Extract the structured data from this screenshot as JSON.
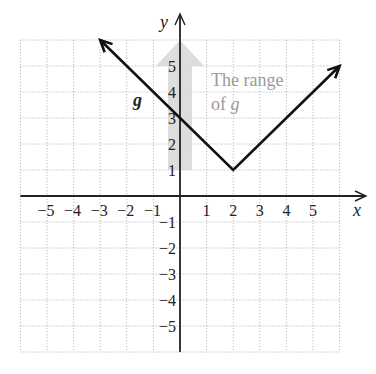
{
  "chart_data": {
    "type": "line",
    "title": "",
    "function": "g(x) = |x - 2| + 1",
    "xlabel": "x",
    "ylabel": "y",
    "xlim": [
      -6,
      6
    ],
    "ylim": [
      -6,
      6
    ],
    "grid": true,
    "x_ticks": [
      -5,
      -4,
      -3,
      -2,
      -1,
      1,
      2,
      3,
      4,
      5
    ],
    "y_ticks": [
      5,
      4,
      3,
      2,
      1,
      -1,
      -2,
      -3,
      -4,
      -5
    ],
    "x_tick_labels": [
      "−5",
      "−4",
      "−3",
      "−2",
      "−1",
      "1",
      "2",
      "3",
      "4",
      "5"
    ],
    "y_tick_labels": [
      "5",
      "4",
      "3",
      "2",
      "1",
      "−1",
      "−2",
      "−3",
      "−4",
      "−5"
    ],
    "series": [
      {
        "name": "g",
        "points": [
          [
            -3,
            6
          ],
          [
            2,
            1
          ],
          [
            6,
            5
          ]
        ],
        "arrows_at_ends": true,
        "vertex": [
          2,
          1
        ],
        "y_intercept": [
          0,
          3
        ]
      }
    ],
    "annotations": [
      {
        "text": "g",
        "at": [
          -1.4,
          3.6
        ],
        "style": "bold italic"
      },
      {
        "text_line1": "The range",
        "text_line2_prefix": "of ",
        "text_line2_var": "g",
        "at": [
          1.2,
          4.3
        ],
        "color": "#9a9a9a"
      },
      {
        "shape": "shaded-arrow",
        "from": [
          0,
          1
        ],
        "to": [
          0,
          6
        ],
        "color": "#d9d9d9",
        "meaning": "range of g is [1, ∞)"
      }
    ]
  },
  "labels": {
    "x_axis": "x",
    "y_axis": "y",
    "function_name": "g",
    "range_line1": "The range",
    "range_line2_prefix": "of ",
    "range_line2_var": "g"
  },
  "colors": {
    "line": "#111111",
    "grid": "#b8b8b8",
    "range_arrow": "#d9d9d9",
    "range_text": "#9a9a9a"
  }
}
